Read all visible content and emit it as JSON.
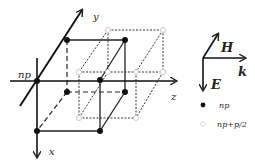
{
  "diagram": {
    "axes": {
      "origin_label": "np",
      "x_label": "x",
      "y_label": "y",
      "z_label": "z"
    },
    "field_orientation": {
      "H_label": "H",
      "k_label": "k",
      "E_label": "E"
    },
    "legend": {
      "items": [
        {
          "marker": "filled-circle",
          "label": "np"
        },
        {
          "marker": "hollow-circle",
          "label": "np+p/2"
        }
      ]
    },
    "colors": {
      "line": "#222222",
      "filled_node": "#111111",
      "hollow_node": "#dddddd"
    }
  }
}
